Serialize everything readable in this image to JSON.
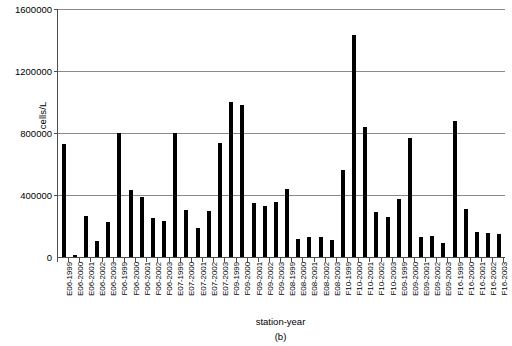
{
  "chart_data": {
    "type": "bar",
    "title": "",
    "subtitle": "",
    "caption": "(b)",
    "xlabel": "station-year",
    "ylabel": "cells/L",
    "ylim": [
      0,
      1600000
    ],
    "ytick_values": [
      0,
      400000,
      800000,
      1200000,
      1600000
    ],
    "ytick_labels": [
      "0",
      "400000",
      "800000",
      "1200000",
      "1600000"
    ],
    "grid": true,
    "legend": "none",
    "bar_color": "#000000",
    "axis_color": "#4d4d4d",
    "grid_color": "#8a8a8a",
    "categories": [
      "E06-1999",
      "E06-2000",
      "E06-2001",
      "E06-2002",
      "E06-2003",
      "F06-1999",
      "F06-2000",
      "F06-2001",
      "F06-2002",
      "F06-2003",
      "E07-1999",
      "E07-2000",
      "E07-2001",
      "E07-2002",
      "E07-2003",
      "F09-1999",
      "F09-2000",
      "F09-2001",
      "F09-2002",
      "F09-2003",
      "E08-1999",
      "E08-2000",
      "E08-2001",
      "E08-2002",
      "E08-2003",
      "F10-1999",
      "F10-2000",
      "F10-2001",
      "F10-2002",
      "F10-2003",
      "E09-1999",
      "E09-2000",
      "E09-2001",
      "E09-2002",
      "E09-2003",
      "F16-1999",
      "F16-2000",
      "F16-2001",
      "F16-2002",
      "F16-2003"
    ],
    "values": [
      730000,
      10000,
      265000,
      105000,
      225000,
      800000,
      430000,
      385000,
      250000,
      230000,
      800000,
      305000,
      185000,
      295000,
      735000,
      1000000,
      980000,
      350000,
      330000,
      355000,
      440000,
      115000,
      130000,
      130000,
      110000,
      560000,
      1430000,
      840000,
      290000,
      260000,
      375000,
      765000,
      130000,
      135000,
      90000,
      875000,
      310000,
      160000,
      155000,
      150000
    ],
    "unit": "cells/L",
    "n_categories": 40
  }
}
